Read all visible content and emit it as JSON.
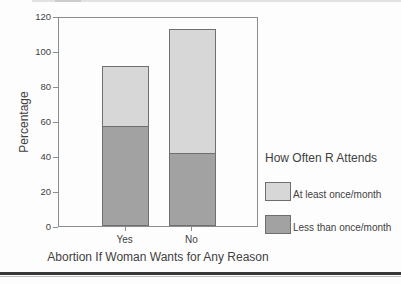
{
  "chart_data": {
    "type": "bar",
    "stacked": true,
    "categories": [
      "Yes",
      "No"
    ],
    "series": [
      {
        "name": "Less than once/month",
        "color": "#a2a2a2",
        "values": [
          57,
          42
        ]
      },
      {
        "name": "At least once/month",
        "color": "#d7d7d7",
        "values": [
          35,
          71
        ]
      }
    ],
    "xlabel": "Abortion If Woman Wants for Any Reason",
    "ylabel": "Percentage",
    "ylim": [
      0,
      120
    ],
    "yticks": [
      0,
      20,
      40,
      60,
      80,
      100,
      120
    ],
    "grid": false,
    "legend": {
      "title": "How Often R Attends",
      "position": "right",
      "entries": [
        {
          "label": "At least once/month",
          "color": "#d7d7d7"
        },
        {
          "label": "Less than once/month",
          "color": "#a2a2a2"
        }
      ]
    }
  },
  "colors": {
    "background": "#fdfdfd",
    "text": "#3f3f3f",
    "axis": "#8c8c8c",
    "bar_border": "#6f6f6f",
    "rule_dark": "#383838",
    "rule_light": "#bdbdbd"
  }
}
